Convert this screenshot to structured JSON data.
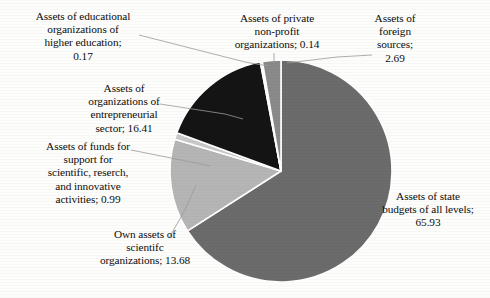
{
  "chart_data": {
    "type": "pie",
    "title": "",
    "subtitle": "",
    "xlabel": "",
    "ylabel": "",
    "legend_position": "none",
    "grid": false,
    "units": "percent",
    "total": 100.01,
    "categories": [
      "Assets of state budgets of all levels",
      "Own assets of scientifc organizations",
      "Assets of funds for support for scientific, reserch, and innovative activities",
      "Assets of organizations of entrepreneurial sector",
      "Assets of educational organizations of higher education",
      "Assets of private non-profit organizations",
      "Assets of foreign sources"
    ],
    "values": [
      65.93,
      13.68,
      0.99,
      16.41,
      0.17,
      0.14,
      2.69
    ],
    "slices": [
      {
        "label": "Assets of state budgets of all levels",
        "value": 65.93,
        "value_text": "65.93",
        "label_text": "Assets of state\nbudgets of all levels;\n65.93",
        "color": "#6b6b6b",
        "start_angle": 0,
        "end_angle": 237.35
      },
      {
        "label": "Own assets of scientifc organizations",
        "value": 13.68,
        "value_text": "13.68",
        "label_text": "Own assets of\nscientifc\norganizations; 13.68",
        "color": "#b5b5b5",
        "start_angle": 237.35,
        "end_angle": 286.6
      },
      {
        "label": "Assets of funds for support for scientific, reserch, and innovative activities",
        "value": 0.99,
        "value_text": "0.99",
        "label_text": "Assets of funds for\nsupport for\nscientific, reserch,\nand innovative\nactivities; 0.99",
        "color": "#c9c9c9",
        "start_angle": 286.6,
        "end_angle": 290.16
      },
      {
        "label": "Assets of organizations of entrepreneurial sector",
        "value": 16.41,
        "value_text": "16.41",
        "label_text": "Assets of\norganizations of\nentrepreneurial\nsector; 16.41",
        "color": "#141414",
        "start_angle": 290.16,
        "end_angle": 349.24
      },
      {
        "label": "Assets of educational organizations of higher education",
        "value": 0.17,
        "value_text": "0.17",
        "label_text": "Assets of educational\norganizations of\nhigher education;\n0.17",
        "color": "#8d8d8d",
        "start_angle": 349.24,
        "end_angle": 349.85
      },
      {
        "label": "Assets of private non-profit organizations",
        "value": 0.14,
        "value_text": "0.14",
        "label_text": "Assets of private\nnon-profit\norganizations; 0.14",
        "color": "#d0d0d0",
        "start_angle": 349.85,
        "end_angle": 350.35
      },
      {
        "label": "Assets of foreign sources",
        "value": 2.69,
        "value_text": "2.69",
        "label_text": "Assets of\nforeign\nsources;\n2.69",
        "color": "#8a8a8a",
        "start_angle": 350.35,
        "end_angle": 360
      }
    ]
  },
  "labels": {
    "education": "Assets of educational\norganizations of\nhigher education;\n0.17",
    "private": "Assets of private\nnon-profit\norganizations; 0.14",
    "foreign": "Assets of\nforeign\nsources;\n2.69",
    "entrepreneurial": "Assets of\norganizations of\nentrepreneurial\nsector; 16.41",
    "funds": "Assets of funds for\nsupport for\nscientific, reserch,\nand innovative\nactivities; 0.99",
    "own": "Own assets of\nscientifc\norganizations; 13.68",
    "state": "Assets of state\nbudgets of all levels;\n65.93"
  },
  "style": {
    "background": "#fdfdfb",
    "leader_line_color": "#9a9a9a",
    "slice_border": "#ffffff"
  }
}
